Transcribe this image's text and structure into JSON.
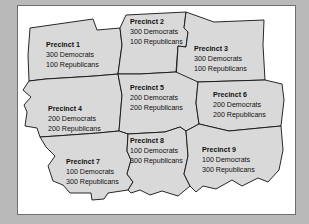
{
  "figure": {
    "kind": "precinct-map",
    "background_color": "#b9b9b9",
    "frame_color": "#6e6e6e",
    "panel_color": "#ffffff",
    "region_fill": "#d9d9d9",
    "region_stroke": "#121212",
    "text_color": "#111111"
  },
  "precincts": [
    {
      "id": "precinct-1",
      "title": "Precinct 1",
      "democrats": "300 Democrats",
      "republicans": "100 Republicans",
      "label_x": 46,
      "label_y": 47,
      "path": "M 30,28 L 93,19 L 97,30 L 120,28 L 122,45 L 118,74 L 95,76 L 46,79 L 29,81 L 28,55 Z"
    },
    {
      "id": "precinct-2",
      "title": "Precinct 2",
      "democrats": "300 Democrats",
      "republicans": "100 Republicans",
      "label_x": 130,
      "label_y": 24,
      "path": "M 120,28 L 126,15 L 186,12 L 184,28 L 188,32 L 186,47 L 178,46 L 176,72 L 140,74 L 118,74 L 122,45 Z"
    },
    {
      "id": "precinct-3",
      "title": "Precinct 3",
      "democrats": "300 Democrats",
      "republicans": "100 Republicans",
      "label_x": 194,
      "label_y": 51,
      "path": "M 186,47 L 188,32 L 184,28 L 186,12 L 214,22 L 264,20 L 263,45 L 265,80 L 198,82 L 176,80 L 178,46 Z"
    },
    {
      "id": "precinct-4",
      "title": "Precinct 4",
      "democrats": "200 Democrats",
      "republicans": "200 Republicans",
      "label_x": 48,
      "label_y": 111,
      "path": "M 29,81 L 46,79 L 95,76 L 118,74 L 122,95 L 119,131 L 98,133 L 56,136 L 40,137 L 37,128 L 25,126 L 27,112 L 24,105 L 31,97 L 23,90 Z"
    },
    {
      "id": "precinct-5",
      "title": "Precinct 5",
      "democrats": "200 Democrats",
      "republicans": "200 Republicans",
      "label_x": 130,
      "label_y": 90,
      "path": "M 118,74 L 140,74 L 176,72 L 198,82 L 196,103 L 199,124 L 186,131 L 180,127 L 165,132 L 128,134 L 119,131 L 122,95 Z"
    },
    {
      "id": "precinct-6",
      "title": "Precinct 6",
      "democrats": "200 Democrats",
      "republicans": "200 Republicans",
      "label_x": 213,
      "label_y": 97,
      "path": "M 198,82 L 265,80 L 282,84 L 284,100 L 281,126 L 260,128 L 229,131 L 199,124 L 196,103 Z"
    },
    {
      "id": "precinct-7",
      "title": "Precinct 7",
      "democrats": "100 Democrats",
      "republicans": "300 Republicans",
      "label_x": 66,
      "label_y": 164,
      "path": "M 40,137 L 56,136 L 98,133 L 119,131 L 128,134 L 127,151 L 131,160 L 127,174 L 133,182 L 128,190 L 108,193 L 104,199 L 92,200 L 91,193 L 70,193 L 63,185 L 53,181 L 48,166 L 55,156 L 46,147 Z"
    },
    {
      "id": "precinct-8",
      "title": "Precinct 8",
      "democrats": "100 Democrats",
      "republicans": "300 Republicans",
      "label_x": 130,
      "label_y": 143,
      "path": "M 128,134 L 165,132 L 180,127 L 186,131 L 188,156 L 184,174 L 190,186 L 178,196 L 162,191 L 150,195 L 140,190 L 131,193 L 128,190 L 133,182 L 127,174 L 131,160 L 127,151 Z"
    },
    {
      "id": "precinct-9",
      "title": "Precinct 9",
      "democrats": "100 Democrats",
      "republicans": "300 Republicans",
      "label_x": 202,
      "label_y": 152,
      "path": "M 186,131 L 199,124 L 229,131 L 260,128 L 281,126 L 283,150 L 279,170 L 268,182 L 258,178 L 242,186 L 232,180 L 216,189 L 203,186 L 196,192 L 190,186 L 184,174 L 188,156 Z"
    }
  ]
}
